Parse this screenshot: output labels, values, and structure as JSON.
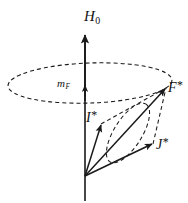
{
  "figure": {
    "width": 188,
    "height": 203,
    "background_color": "#ffffff",
    "stroke_color": "#1a1a1a"
  },
  "labels": {
    "field_axis": {
      "base": "H",
      "sub": "0",
      "text": "H0",
      "name": "magnetic-field-axis-label"
    },
    "projection": {
      "base": "m",
      "sub": "F",
      "text": "mF",
      "name": "magnetic-quantum-number-label"
    },
    "total_angular_momentum": {
      "base": "F",
      "star": "*",
      "text": "F*",
      "name": "F-star-vector-label"
    },
    "nuclear_spin": {
      "base": "I",
      "star": "*",
      "text": "I*",
      "name": "I-star-vector-label"
    },
    "electronic_angular_momentum": {
      "base": "J",
      "star": "*",
      "text": "J*",
      "name": "J-star-vector-label"
    }
  },
  "geometry": {
    "origin": {
      "x": 85,
      "y": 176
    },
    "axis": {
      "x": 85,
      "y_top": 34,
      "y_bottom": 201
    },
    "vectors": [
      {
        "name": "H0",
        "from": [
          85,
          176
        ],
        "to": [
          85,
          34
        ],
        "style": "solid",
        "arrow": true
      },
      {
        "name": "mF",
        "from": [
          85,
          100
        ],
        "to": [
          85,
          84
        ],
        "style": "solid",
        "arrow": true
      },
      {
        "name": "I*",
        "from": [
          85,
          176
        ],
        "to": [
          101,
          124
        ],
        "style": "solid",
        "arrow": true
      },
      {
        "name": "J*",
        "from": [
          85,
          176
        ],
        "to": [
          153,
          144
        ],
        "style": "solid",
        "arrow": true
      },
      {
        "name": "F*",
        "from": [
          85,
          176
        ],
        "to": [
          166,
          88
        ],
        "style": "solid",
        "arrow": true
      }
    ],
    "dashed_parallelogram": [
      {
        "from": [
          101,
          124
        ],
        "to": [
          166,
          88
        ]
      },
      {
        "from": [
          153,
          144
        ],
        "to": [
          166,
          88
        ]
      }
    ],
    "precession_ellipse_large": {
      "cx": 90,
      "cy": 83,
      "rx": 82,
      "ry": 20,
      "rotation": -2,
      "style": "dashed"
    },
    "precession_ellipse_small": {
      "cx": 128,
      "cy": 133,
      "rx": 34,
      "ry": 14,
      "rotation": -58,
      "style": "dashed"
    }
  },
  "style": {
    "line_width": 1.3,
    "dash_pattern": "4 3"
  }
}
